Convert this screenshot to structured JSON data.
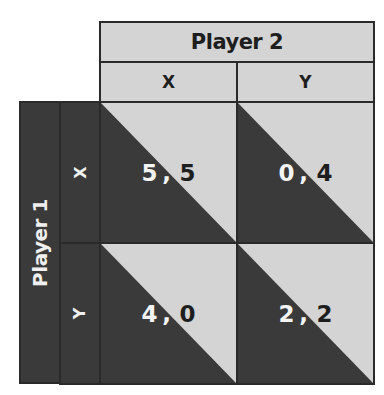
{
  "player2": {
    "label": "Player 2",
    "strategies": [
      "X",
      "Y"
    ]
  },
  "player1": {
    "label": "Player 1",
    "strategies": [
      "X",
      "Y"
    ]
  },
  "payoffs": {
    "XX": {
      "p1": "5",
      "sep": ",",
      "p2": "5"
    },
    "XY": {
      "p1": "0",
      "sep": ",",
      "p2": "4"
    },
    "YX": {
      "p1": "4",
      "sep": ",",
      "p2": "0"
    },
    "YY": {
      "p1": "2",
      "sep": ",",
      "p2": "2"
    }
  },
  "colors": {
    "light_gray": "#d4d4d4",
    "dark_gray": "#3a3a3a",
    "border": "#2a2a2a"
  }
}
